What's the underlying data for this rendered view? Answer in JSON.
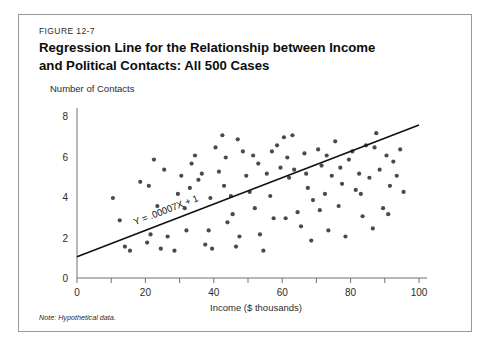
{
  "figure": {
    "number": "FIGURE 12-7",
    "title_line1": "Regression Line for the Relationship between Income",
    "title_line2": "and Political Contacts: All 500 Cases",
    "note": "Note: Hypothetical data.",
    "border_color": "#9a9a9a"
  },
  "chart_data": {
    "type": "scatter",
    "title": "Regression Line for the Relationship between Income and Political Contacts: All 500 Cases",
    "subtitle": "",
    "xlabel": "Income ($ thousands)",
    "ylabel": "Number of Contacts",
    "xlim": [
      0,
      100
    ],
    "ylim": [
      0,
      8
    ],
    "grid": false,
    "legend": null,
    "xticks": [
      0,
      10,
      20,
      30,
      40,
      50,
      60,
      70,
      80,
      90,
      100
    ],
    "xtick_labels": [
      "0",
      "",
      "20",
      "",
      "40",
      "",
      "60",
      "",
      "80",
      "",
      "100"
    ],
    "yticks": [
      0,
      2,
      4,
      6,
      8
    ],
    "ytick_labels": [
      "0",
      "2",
      "4",
      "6",
      "8"
    ],
    "annotation": "Y = .00007X + 1",
    "dot_color": "#4a4a4a",
    "line_color": "#111111",
    "regression_line": {
      "equation": "Y = .00007X + 1",
      "x_start": 0,
      "y_start": 1.05,
      "x_end": 100,
      "y_end": 7.55
    },
    "points": [
      [
        10.5,
        3.95
      ],
      [
        12.5,
        2.85
      ],
      [
        15.5,
        1.35
      ],
      [
        14.0,
        1.55
      ],
      [
        21.0,
        4.55
      ],
      [
        22.5,
        5.85
      ],
      [
        21.5,
        2.15
      ],
      [
        20.5,
        1.75
      ],
      [
        24.5,
        1.45
      ],
      [
        26.5,
        2.05
      ],
      [
        28.5,
        1.35
      ],
      [
        30.5,
        5.05
      ],
      [
        31.5,
        3.45
      ],
      [
        33.0,
        4.45
      ],
      [
        32.0,
        2.35
      ],
      [
        34.5,
        6.05
      ],
      [
        36.5,
        5.15
      ],
      [
        35.5,
        4.85
      ],
      [
        37.5,
        1.65
      ],
      [
        38.5,
        2.35
      ],
      [
        39.5,
        1.45
      ],
      [
        40.5,
        6.45
      ],
      [
        41.5,
        5.25
      ],
      [
        42.5,
        7.05
      ],
      [
        43.0,
        4.55
      ],
      [
        44.0,
        2.75
      ],
      [
        45.5,
        3.15
      ],
      [
        46.5,
        1.55
      ],
      [
        47.5,
        2.05
      ],
      [
        48.5,
        6.25
      ],
      [
        49.5,
        5.05
      ],
      [
        50.5,
        4.25
      ],
      [
        51.5,
        6.05
      ],
      [
        52.0,
        3.45
      ],
      [
        53.5,
        2.15
      ],
      [
        54.5,
        1.35
      ],
      [
        55.5,
        5.15
      ],
      [
        56.5,
        4.05
      ],
      [
        57.5,
        2.95
      ],
      [
        58.5,
        6.55
      ],
      [
        59.5,
        5.45
      ],
      [
        60.5,
        6.95
      ],
      [
        61.5,
        5.95
      ],
      [
        62.0,
        4.95
      ],
      [
        63.5,
        5.35
      ],
      [
        64.5,
        3.25
      ],
      [
        65.5,
        2.55
      ],
      [
        66.5,
        6.15
      ],
      [
        67.5,
        4.45
      ],
      [
        68.5,
        1.85
      ],
      [
        69.0,
        3.85
      ],
      [
        70.5,
        6.35
      ],
      [
        71.5,
        5.55
      ],
      [
        72.5,
        4.15
      ],
      [
        73.5,
        2.35
      ],
      [
        74.5,
        5.05
      ],
      [
        75.5,
        6.75
      ],
      [
        76.5,
        3.55
      ],
      [
        77.5,
        4.65
      ],
      [
        78.5,
        2.05
      ],
      [
        79.5,
        5.85
      ],
      [
        80.5,
        6.25
      ],
      [
        81.5,
        4.35
      ],
      [
        82.5,
        5.15
      ],
      [
        83.5,
        3.05
      ],
      [
        84.5,
        6.55
      ],
      [
        85.5,
        4.95
      ],
      [
        86.5,
        2.45
      ],
      [
        87.5,
        7.15
      ],
      [
        88.5,
        5.35
      ],
      [
        89.5,
        3.45
      ],
      [
        90.5,
        6.05
      ],
      [
        91.5,
        4.55
      ],
      [
        92.5,
        5.75
      ],
      [
        93.5,
        5.05
      ],
      [
        94.5,
        6.35
      ],
      [
        95.5,
        4.25
      ],
      [
        18.5,
        4.75
      ],
      [
        23.5,
        3.55
      ],
      [
        29.5,
        4.15
      ],
      [
        33.5,
        5.65
      ],
      [
        43.5,
        5.95
      ],
      [
        47.0,
        6.85
      ],
      [
        53.0,
        5.65
      ],
      [
        57.0,
        6.25
      ],
      [
        63.0,
        7.05
      ],
      [
        67.0,
        5.15
      ],
      [
        73.0,
        6.05
      ],
      [
        77.0,
        5.45
      ],
      [
        83.0,
        4.15
      ],
      [
        87.0,
        6.45
      ],
      [
        91.0,
        3.15
      ],
      [
        25.5,
        5.35
      ],
      [
        39.0,
        3.95
      ],
      [
        45.0,
        4.05
      ],
      [
        61.0,
        2.95
      ],
      [
        71.0,
        3.35
      ]
    ]
  }
}
